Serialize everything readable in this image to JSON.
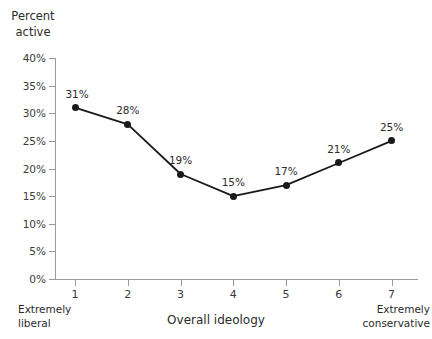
{
  "chart_data": {
    "type": "line",
    "title": "",
    "xlabel": "Overall ideology",
    "ylabel": "Percent\nactive",
    "x": [
      1,
      2,
      3,
      4,
      5,
      6,
      7
    ],
    "categories": [
      "1",
      "2",
      "3",
      "4",
      "5",
      "6",
      "7"
    ],
    "values": [
      31,
      28,
      19,
      15,
      17,
      21,
      25
    ],
    "point_labels": [
      "31%",
      "28%",
      "19%",
      "15%",
      "17%",
      "21%",
      "25%"
    ],
    "ylim": [
      0,
      40
    ],
    "ytick_values": [
      0,
      5,
      10,
      15,
      20,
      25,
      30,
      35,
      40
    ],
    "ytick_labels": [
      "0%",
      "5%",
      "10%",
      "15%",
      "20%",
      "25%",
      "30%",
      "35%",
      "40%"
    ],
    "xlim": [
      0.62,
      7.5
    ],
    "xtick_labels": [
      "1",
      "2",
      "3",
      "4",
      "5",
      "6",
      "7"
    ],
    "x_end_label_left": "Extremely\nliberal",
    "x_end_label_right": "Extremely\nconservative",
    "grid": false,
    "legend": "none",
    "series_color": "#1a1a1a",
    "axis_color": "#9a9a9a",
    "text_color": "#2b2b2b",
    "background": "#ffffff",
    "marker": "circle"
  }
}
